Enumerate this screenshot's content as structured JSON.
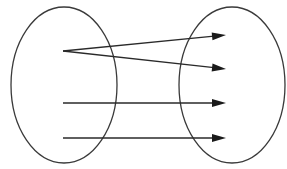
{
  "diagram": {
    "type": "function-mapping",
    "colors": {
      "stroke": "#3a3a3a",
      "arrow": "#1a1a1a",
      "background": "#ffffff"
    },
    "sets": [
      {
        "id": "domain",
        "label": "",
        "cx": 64,
        "cy": 85,
        "rx": 53,
        "ry": 78
      },
      {
        "id": "codomain",
        "label": "",
        "cx": 232,
        "cy": 85,
        "rx": 53,
        "ry": 78
      }
    ],
    "domain_elements": [
      {
        "id": "d1",
        "x": 63,
        "y": 51
      },
      {
        "id": "d2",
        "x": 63,
        "y": 103
      },
      {
        "id": "d3",
        "x": 63,
        "y": 138
      }
    ],
    "codomain_elements": [
      {
        "id": "c1",
        "x": 226,
        "y": 35
      },
      {
        "id": "c2",
        "x": 226,
        "y": 69
      },
      {
        "id": "c3",
        "x": 226,
        "y": 103
      },
      {
        "id": "c4",
        "x": 226,
        "y": 138
      }
    ],
    "arrows": [
      {
        "from": "d1",
        "to": "c1"
      },
      {
        "from": "d1",
        "to": "c2"
      },
      {
        "from": "d2",
        "to": "c3"
      },
      {
        "from": "d3",
        "to": "c4"
      }
    ]
  }
}
